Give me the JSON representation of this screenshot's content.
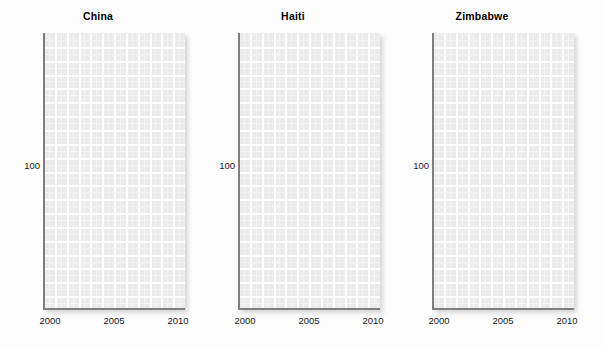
{
  "figure": {
    "background_color": "#fdfdfd",
    "panel_fill_color": "#ebebeb",
    "grid_color": "#ffffff",
    "axis_color": "#7f7f7f",
    "text_color": "#1a1a1a"
  },
  "chart_data": {
    "type": "line",
    "title": "",
    "subtitle": "",
    "xlabel": "",
    "ylabel": "",
    "layout": "faceted-1x3",
    "grid": true,
    "legend": "none",
    "xlim": [
      1999,
      2011
    ],
    "ylim": [
      0,
      175
    ],
    "xticks": [
      2000,
      2005,
      2010
    ],
    "xtick_labels": [
      "2000",
      "2005",
      "2010"
    ],
    "yticks": [
      100
    ],
    "ytick_labels": [
      "100"
    ],
    "panels": [
      {
        "title": "China",
        "x": [
          2000,
          2005,
          2010
        ],
        "values": [],
        "series": []
      },
      {
        "title": "Haiti",
        "x": [
          2000,
          2005,
          2010
        ],
        "values": [],
        "series": []
      },
      {
        "title": "Zimbabwe",
        "x": [
          2000,
          2005,
          2010
        ],
        "values": [],
        "series": []
      }
    ]
  },
  "panels": [
    {
      "title": "China",
      "ytick": "100",
      "xticks": [
        "2000",
        "2005",
        "2010"
      ]
    },
    {
      "title": "Haiti",
      "ytick": "100",
      "xticks": [
        "2000",
        "2005",
        "2010"
      ]
    },
    {
      "title": "Zimbabwe",
      "ytick": "100",
      "xticks": [
        "2000",
        "2005",
        "2010"
      ]
    }
  ]
}
